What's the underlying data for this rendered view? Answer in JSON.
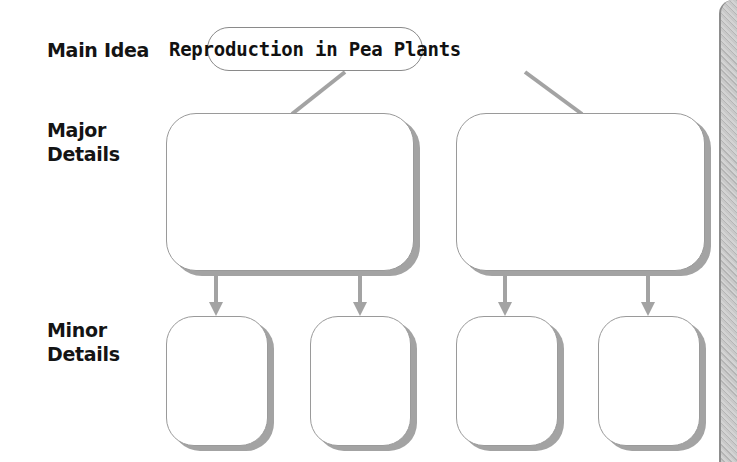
{
  "diagram": {
    "type": "hierarchy-organizer",
    "row_labels": {
      "main_idea": "Main Idea",
      "major_details": [
        "Major",
        "Details"
      ],
      "minor_details": [
        "Minor",
        "Details"
      ]
    },
    "main_idea_text": "Reproduction in Pea Plants",
    "major_boxes": [
      {
        "id": "major-1",
        "text": ""
      },
      {
        "id": "major-2",
        "text": ""
      }
    ],
    "minor_boxes": [
      {
        "id": "minor-1",
        "parent": "major-1",
        "text": ""
      },
      {
        "id": "minor-2",
        "parent": "major-1",
        "text": ""
      },
      {
        "id": "minor-3",
        "parent": "major-2",
        "text": ""
      },
      {
        "id": "minor-4",
        "parent": "major-2",
        "text": ""
      }
    ],
    "colors": {
      "connector": "#a3a3a3",
      "box_border": "#9a9a9a",
      "text": "#141414"
    }
  }
}
